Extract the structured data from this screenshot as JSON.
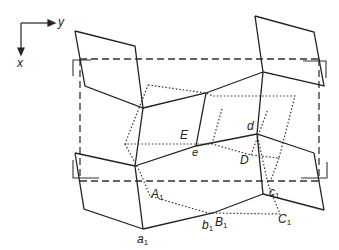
{
  "diagram": {
    "type": "crystal structure projection",
    "axes": {
      "horizontal": "y",
      "vertical": "x"
    },
    "colors": {
      "line": "#222222",
      "background": "#ffffff"
    },
    "labels": {
      "E": "E",
      "e": "e",
      "d": "d",
      "D": "D",
      "A1": "A",
      "A1_sub": "1",
      "a1": "a",
      "a1_sub": "1",
      "b1": "b",
      "b1_sub": "1",
      "B1": "B",
      "B1_sub": "1",
      "c1": "c",
      "c1_sub": "1",
      "C1": "C",
      "C1_sub": "1"
    },
    "line_styles": {
      "solid": "framework polyhedra",
      "dotted": "displaced structure",
      "dashed": "unit cell outline"
    }
  }
}
